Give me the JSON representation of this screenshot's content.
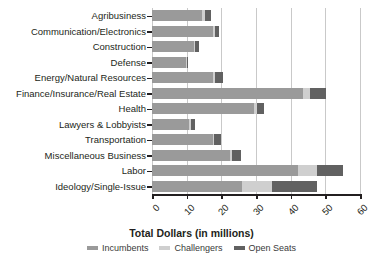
{
  "chart_data": {
    "type": "bar",
    "orientation": "horizontal",
    "stacked": true,
    "title": "",
    "xlabel": "Total Dollars (in millions)",
    "ylabel": "",
    "xlim": [
      0,
      60
    ],
    "xticks": [
      0,
      10,
      20,
      30,
      40,
      50,
      60
    ],
    "xticklabels": [
      "0",
      "10",
      "20",
      "30",
      "40",
      "50",
      "60"
    ],
    "grid": "vertical",
    "legend_position": "bottom",
    "categories": [
      "Agribusiness",
      "Communication/Electronics",
      "Construction",
      "Defense",
      "Energy/Natural Resources",
      "Finance/Insurance/Real Estate",
      "Health",
      "Lawyers & Lobbyists",
      "Transportation",
      "Miscellaneous Business",
      "Labor",
      "Ideology/Single-Issue"
    ],
    "series": [
      {
        "name": "Incumbents",
        "color": "#9a9a9a",
        "values": [
          14.5,
          17.5,
          12.0,
          9.8,
          17.5,
          43.5,
          29.5,
          10.8,
          17.5,
          22.5,
          42.0,
          26.0
        ]
      },
      {
        "name": "Challengers",
        "color": "#cfcfcf",
        "values": [
          0.8,
          0.6,
          0.4,
          0.3,
          0.8,
          2.0,
          0.7,
          0.5,
          0.5,
          0.5,
          5.5,
          8.5
        ]
      },
      {
        "name": "Open Seats",
        "color": "#616161",
        "values": [
          1.8,
          1.2,
          1.2,
          0.2,
          2.3,
          4.8,
          2.1,
          1.2,
          1.8,
          2.8,
          7.5,
          13.0
        ]
      }
    ]
  },
  "legend": {
    "items": [
      {
        "label": "Incumbents",
        "color": "#9a9a9a"
      },
      {
        "label": "Challengers",
        "color": "#cfcfcf"
      },
      {
        "label": "Open Seats",
        "color": "#616161"
      }
    ]
  }
}
